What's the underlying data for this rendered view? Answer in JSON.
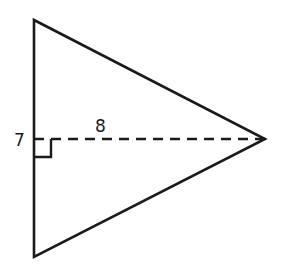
{
  "diagram": {
    "type": "triangle-with-altitude",
    "colors": {
      "stroke": "#1a1a1a",
      "background": "#ffffff"
    },
    "vertices": {
      "top": [
        34,
        20
      ],
      "bottom": [
        34,
        257
      ],
      "apex": [
        265,
        139
      ]
    },
    "altitude": {
      "from": [
        34,
        139
      ],
      "to": [
        265,
        139
      ],
      "style": "dashed"
    },
    "right_angle_marker": {
      "corner": [
        34,
        139
      ],
      "size": 17
    },
    "labels": {
      "base": "7",
      "height": "8"
    }
  }
}
